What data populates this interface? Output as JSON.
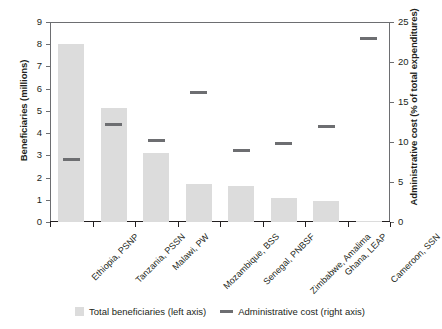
{
  "chart_data": {
    "type": "bar",
    "title": "",
    "xlabel": "",
    "ylabel": "Beneficiaries (millions)",
    "y2label": "Administrative cost (% of total expenditures)",
    "categories": [
      "Ethiopia, PSNP",
      "Tanzania, PSSN",
      "Malawi, PW",
      "Mozambique, BSS",
      "Senegal, PNBSF",
      "Zimbabwe, Amalima",
      "Ghana, LEAP",
      "Cameroon, SSN"
    ],
    "series": [
      {
        "name": "Total beneficiaries (left axis)",
        "axis": "left",
        "type": "bar",
        "color": "#dcdcdc",
        "values": [
          8.0,
          5.15,
          3.1,
          1.7,
          1.6,
          1.1,
          0.95,
          0.05
        ]
      },
      {
        "name": "Administrative cost (right axis)",
        "axis": "right",
        "type": "marker",
        "color": "#6d6e71",
        "values": [
          7.8,
          12.2,
          10.2,
          16.2,
          9.0,
          9.8,
          12.0,
          23.0
        ]
      }
    ],
    "ylim": [
      0,
      9
    ],
    "y2lim": [
      0,
      25
    ],
    "yticks": [
      0,
      1,
      2,
      3,
      4,
      5,
      6,
      7,
      8,
      9
    ],
    "y2ticks": [
      0,
      5,
      10,
      15,
      20,
      25
    ],
    "yticklabels": [
      "0",
      "1",
      "2",
      "3",
      "4",
      "5",
      "6",
      "7",
      "8",
      "9"
    ],
    "y2ticklabels": [
      "0",
      "5",
      "10",
      "15",
      "20",
      "25"
    ],
    "grid": false,
    "legend_position": "bottom"
  },
  "legend": {
    "items": [
      {
        "label": "Total beneficiaries (left axis)",
        "marker": "square-swatch"
      },
      {
        "label": "Administrative cost (right axis)",
        "marker": "line-swatch"
      }
    ]
  }
}
